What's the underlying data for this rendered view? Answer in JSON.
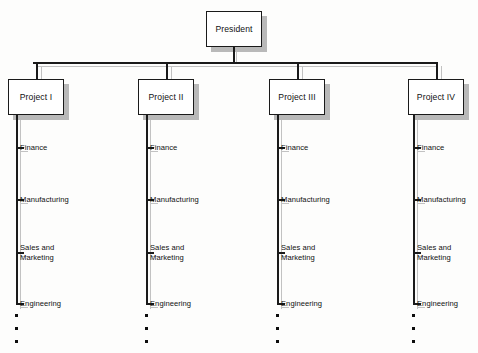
{
  "diagram": {
    "type": "org-chart",
    "colors": {
      "line": "#1a1a1a",
      "shadow": "#b9b9b9",
      "box_fill": "#ffffff",
      "text": "#111111",
      "background": "#fdfdfc"
    },
    "root": {
      "label": "President",
      "x": 206,
      "y": 11,
      "width": 56,
      "height": 36
    },
    "bus": {
      "y": 62,
      "x_start": 33,
      "x_end": 437
    },
    "branch_labels": [
      "Finance",
      "Manufacturing",
      "Sales and\nMarketing",
      "Engineering"
    ],
    "branch_y": [
      147,
      199,
      252,
      303
    ],
    "ellipsis_count": 3,
    "columns": [
      {
        "label": "Project I",
        "box_x": 8,
        "box_y": 79,
        "box_width": 56,
        "box_height": 36,
        "stem_x": 16,
        "label_x": 20,
        "branches": [
          "Finance",
          "Manufacturing",
          "Sales and\nMarketing",
          "Engineering"
        ]
      },
      {
        "label": "Project II",
        "box_x": 138,
        "box_y": 79,
        "box_width": 56,
        "box_height": 36,
        "stem_x": 146,
        "label_x": 150,
        "branches": [
          "Finance",
          "Manufacturing",
          "Sales and\nMarketing",
          "Engineering"
        ]
      },
      {
        "label": "Project III",
        "box_x": 269,
        "box_y": 79,
        "box_width": 56,
        "box_height": 36,
        "stem_x": 277,
        "label_x": 281,
        "branches": [
          "Finance",
          "Manufacturing",
          "Sales and\nMarketing",
          "Engineering"
        ]
      },
      {
        "label": "Project IV",
        "box_x": 408,
        "box_y": 79,
        "box_width": 56,
        "box_height": 36,
        "stem_x": 413,
        "label_x": 417,
        "branches": [
          "Finance",
          "Manufacturing",
          "Sales and\nMarketing",
          "Engineering"
        ]
      }
    ]
  }
}
